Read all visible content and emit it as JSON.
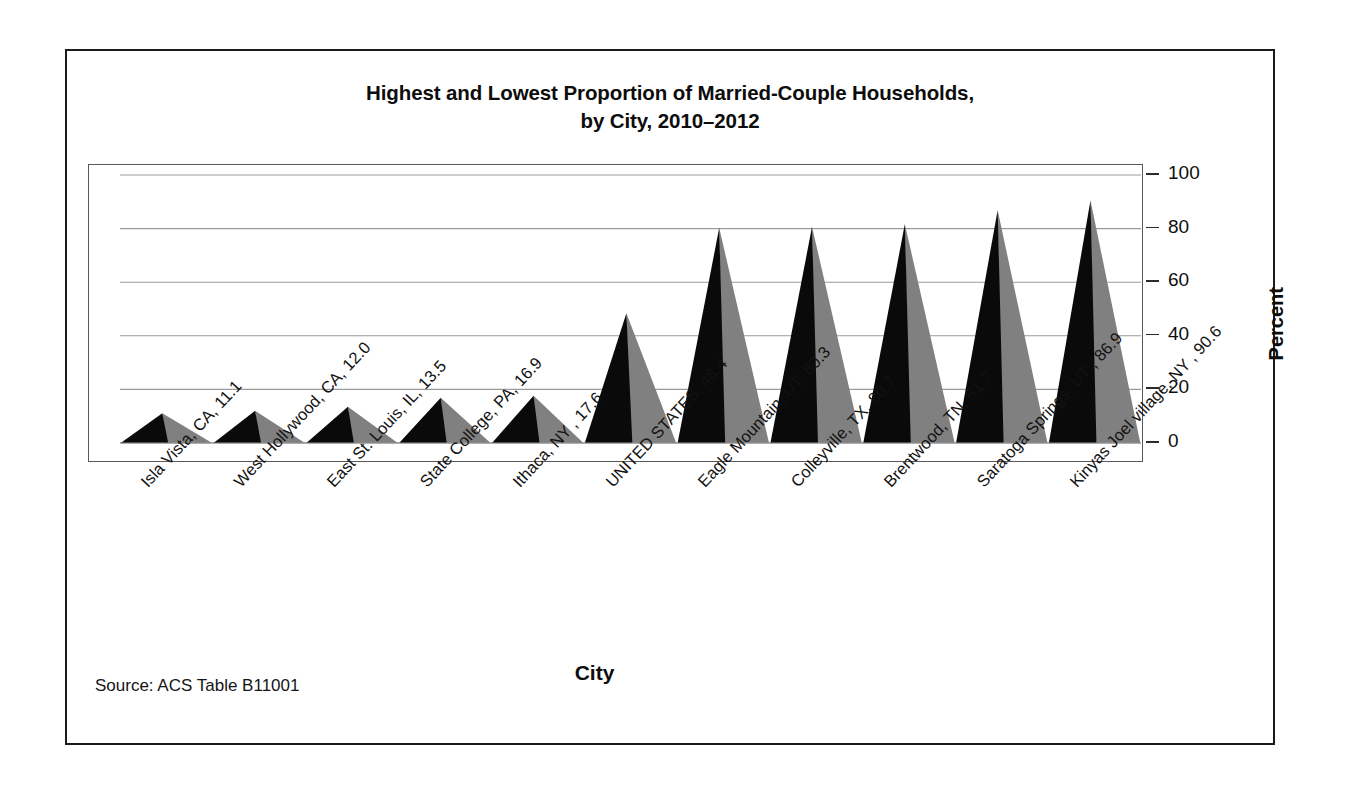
{
  "figure": {
    "title_line1": "Highest and Lowest Proportion of Married-Couple Households,",
    "title_line2": "by City, 2010–2012",
    "source_note": "Source: ACS Table B11001",
    "colors": {
      "cone_front": "#0a0a0a",
      "cone_side": "#808080",
      "gridline": "#9a9a9a",
      "frame": "#595959",
      "outer_border": "#1b1b1b",
      "text": "#0d0d0d",
      "background": "#ffffff"
    }
  },
  "chart_data": {
    "type": "bar",
    "title": "Highest and Lowest Proportion of Married-Couple Households, by City, 2010–2012",
    "subtitle": "",
    "xlabel": "City",
    "ylabel": "Percent",
    "ylim": [
      0,
      100
    ],
    "yticks": [
      0,
      20,
      40,
      60,
      80,
      100
    ],
    "ytick_labels": [
      "0",
      "20",
      "40",
      "60",
      "80",
      "100"
    ],
    "grid": true,
    "grid_axis": "y",
    "legend": false,
    "legend_position": "none",
    "bar_style": "3d-cone",
    "categories": [
      "Isla Vista, CA, 11.1",
      "West Hollywood, CA, 12.0",
      "East St. Louis, IL, 13.5",
      "State College, PA, 16.9",
      "Ithaca, NY , 17.6",
      "UNITED STATES, 48.4",
      "Eagle Mountain, UT, 80.3",
      "Colleyville, TX, 80.7",
      "Brentwood, TN, 81.7",
      "Saratoga Springs, UT , 86.9",
      "Kinyas Joel village, NY , 90.6"
    ],
    "place_names": [
      "Isla Vista, CA",
      "West Hollywood, CA",
      "East St. Louis, IL",
      "State College, PA",
      "Ithaca, NY",
      "UNITED STATES",
      "Eagle Mountain, UT",
      "Colleyville, TX",
      "Brentwood, TN",
      "Saratoga Springs, UT",
      "Kinyas Joel village, NY"
    ],
    "values": [
      11.1,
      12.0,
      13.5,
      16.9,
      17.6,
      48.4,
      80.3,
      80.7,
      81.7,
      86.9,
      90.6
    ]
  }
}
